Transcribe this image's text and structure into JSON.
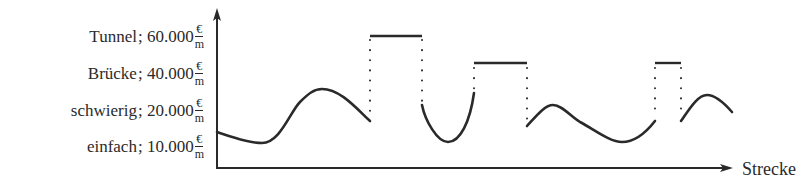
{
  "y_axis": {
    "levels": [
      {
        "name": "Tunnel",
        "amount": "60.000",
        "unit_num": "€",
        "unit_den": "m",
        "label_sep": "; "
      },
      {
        "name": "Brücke",
        "amount": "40.000",
        "unit_num": "€",
        "unit_den": "m",
        "label_sep": "; "
      },
      {
        "name": "schwierig",
        "amount": "20.000",
        "unit_num": "€",
        "unit_den": "m",
        "label_sep": "; "
      },
      {
        "name": "einfach",
        "amount": "10.000",
        "unit_num": "€",
        "unit_den": "m",
        "label_sep": "; "
      }
    ]
  },
  "x_axis": {
    "label": "Strecke"
  },
  "colors": {
    "line": "#2a2a2a",
    "background": "#ffffff"
  },
  "chart_data": {
    "type": "line",
    "title": "",
    "xlabel": "Strecke",
    "ylabel": "",
    "grid": false,
    "y_levels": [
      {
        "label": "Tunnel; 60.000 €/m",
        "value": 60000
      },
      {
        "label": "Brücke; 40.000 €/m",
        "value": 40000
      },
      {
        "label": "schwierig; 20.000 €/m",
        "value": 20000
      },
      {
        "label": "einfach; 10.000 €/m",
        "value": 10000
      }
    ],
    "axes": {
      "origin": [
        217,
        168
      ],
      "y_top": 8,
      "x_right": 733
    },
    "segments": [
      {
        "kind": "terrain",
        "d": "M217,132 C232,137 248,143 262,143 C280,143 290,112 300,102 C308,94 314,89 322,89 C340,89 356,108 370,121"
      },
      {
        "kind": "tunnel",
        "x": [
          370,
          422
        ],
        "y": 36,
        "drops": [
          [
            370,
            40,
            118
          ],
          [
            422,
            40,
            101
          ]
        ]
      },
      {
        "kind": "terrain",
        "d": "M422,105 C425,120 437,142 448,142 C460,142 470,122 474,93"
      },
      {
        "kind": "bridge",
        "x": [
          474,
          527
        ],
        "y": 63,
        "drops": [
          [
            474,
            68,
            90
          ],
          [
            527,
            68,
            123
          ]
        ]
      },
      {
        "kind": "terrain",
        "d": "M527,126 C537,115 545,105 553,105 C562,105 570,116 580,122 C595,130 610,142 622,142 C637,142 648,130 655,121"
      },
      {
        "kind": "bridge",
        "x": [
          655,
          681
        ],
        "y": 63,
        "drops": [
          [
            655,
            68,
            118
          ],
          [
            681,
            68,
            118
          ]
        ]
      },
      {
        "kind": "terrain",
        "d": "M681,121 C690,108 698,95 707,95 C716,95 725,104 732,112"
      }
    ]
  }
}
